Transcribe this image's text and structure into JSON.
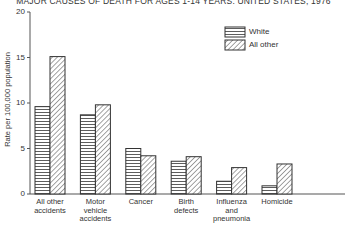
{
  "chart_data": {
    "type": "bar",
    "title": "MAJOR CAUSES OF DEATH FOR AGES 1-14 YEARS: UNITED STATES, 1976",
    "xlabel": "",
    "ylabel": "Rate per 100,000 population",
    "ylim": [
      0,
      20
    ],
    "yticks": [
      0,
      5,
      10,
      15,
      20
    ],
    "grid": false,
    "legend_position": "upper right",
    "categories": [
      "All other accidents",
      "Motor vehicle accidents",
      "Cancer",
      "Birth defects",
      "Influenza and pneumonia",
      "Homicide"
    ],
    "series": [
      {
        "name": "White",
        "pattern": "horizontal-lines",
        "values": [
          9.6,
          8.7,
          5.0,
          3.6,
          1.4,
          0.9
        ]
      },
      {
        "name": "All other",
        "pattern": "diagonal-hatch",
        "values": [
          15.1,
          9.8,
          4.2,
          4.1,
          2.9,
          3.3
        ]
      }
    ]
  },
  "labels": {
    "title": "MAJOR CAUSES OF DEATH FOR AGES 1-14 YEARS: UNITED STATES, 1976",
    "ylabel": "Rate per 100,000 population",
    "ticks": [
      "0",
      "5",
      "10",
      "15",
      "20"
    ],
    "categories": [
      [
        "All other",
        "accidents"
      ],
      [
        "Motor",
        "vehicle",
        "accidents"
      ],
      [
        "Cancer"
      ],
      [
        "Birth",
        "defects"
      ],
      [
        "Influenza",
        "and",
        "pneumonia"
      ],
      [
        "Homicide"
      ]
    ],
    "legend": [
      "White",
      "All other"
    ]
  }
}
